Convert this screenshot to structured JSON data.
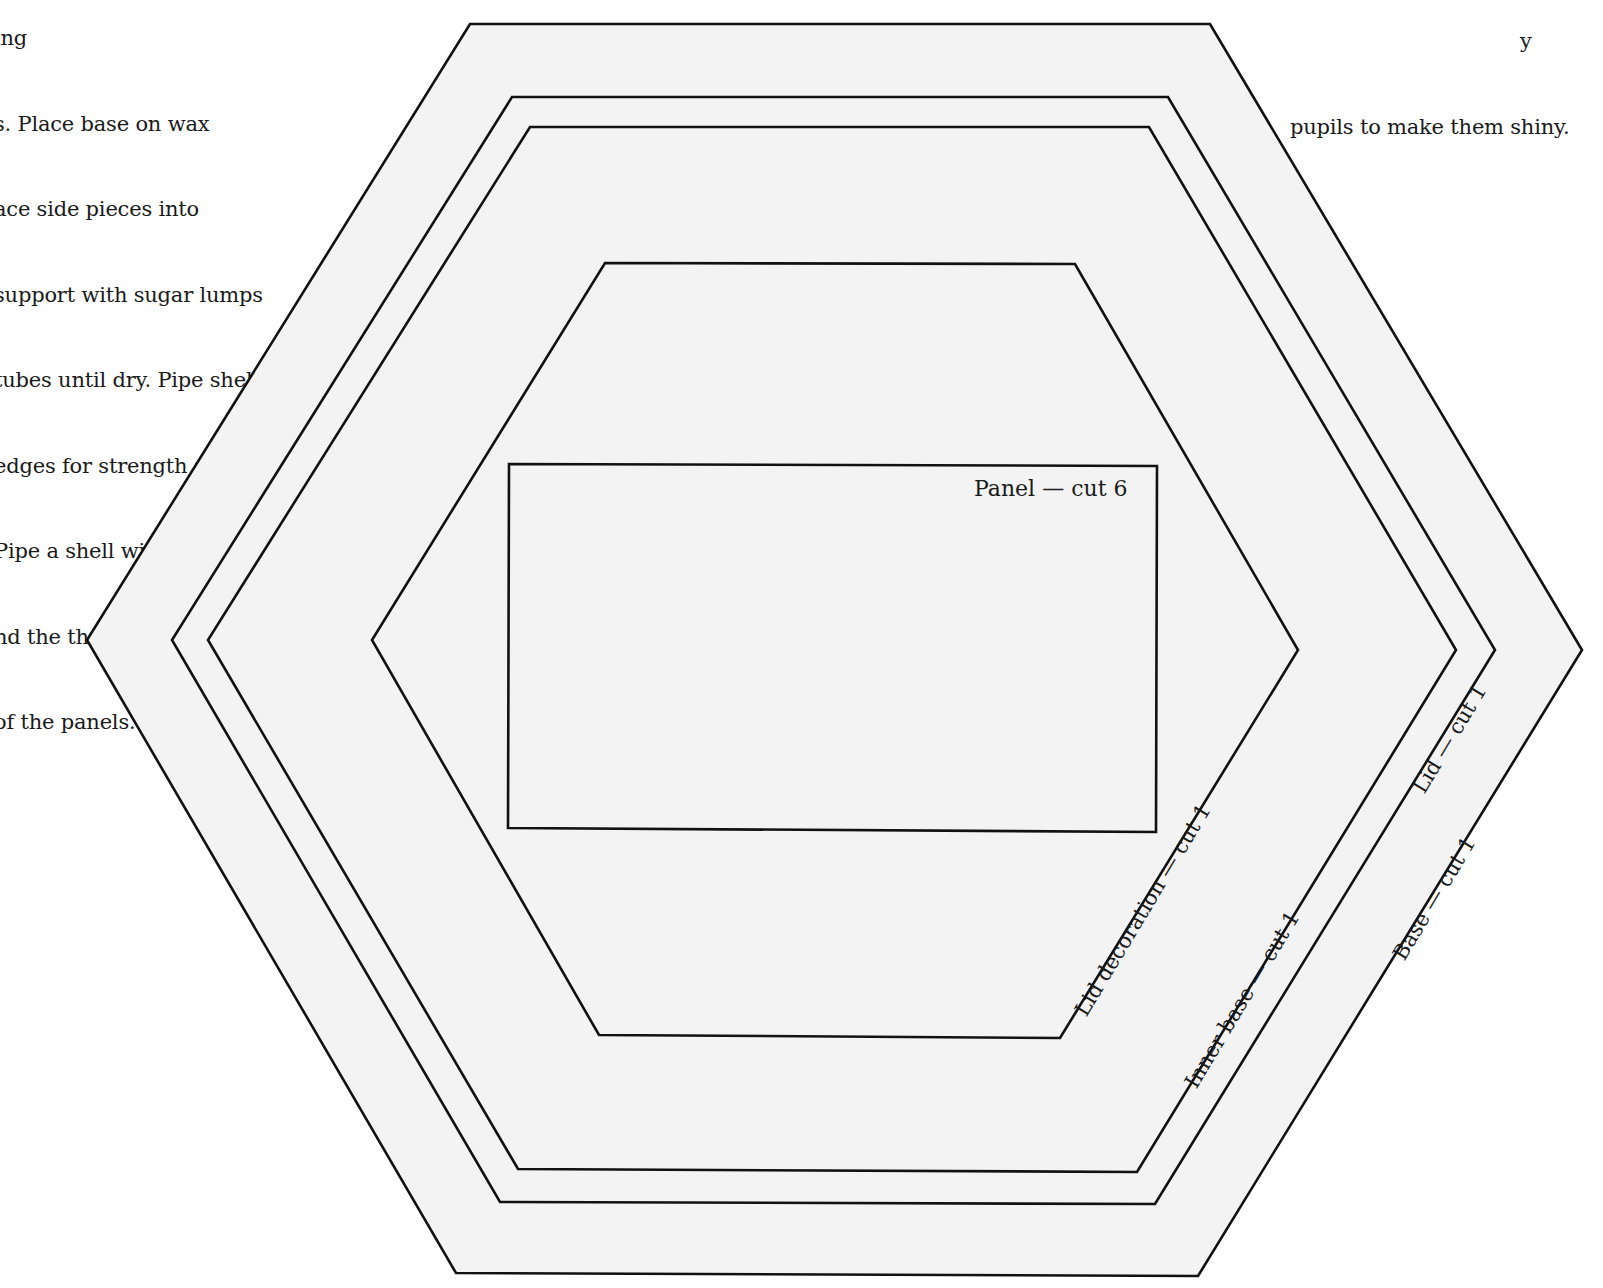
{
  "instructions_left": {
    "lines": [
      "ing",
      "s. Place base on wax",
      "ace side pieces into",
      "support with sugar lumps",
      "tubes until dry. Pipe shells",
      "edges for strength and",
      "Pipe a shell with a No2",
      "nd the three edges and up",
      "of the panels."
    ]
  },
  "instructions_right": {
    "lines": [
      "y",
      "pupils to make them shiny."
    ]
  },
  "template": {
    "background_color": "#ffffff",
    "fill_color": "#f3f3f3",
    "stroke_color": "#111111",
    "pieces": [
      {
        "id": "base",
        "label": "Base — cut 1",
        "shape": "hexagon"
      },
      {
        "id": "lid",
        "label": "Lid — cut 1",
        "shape": "hexagon"
      },
      {
        "id": "inner-base",
        "label": "Inner base — cut 1",
        "shape": "hexagon"
      },
      {
        "id": "lid-decoration",
        "label": "Lid decoration — cut 1",
        "shape": "hexagon"
      },
      {
        "id": "panel",
        "label": "Panel — cut 6",
        "shape": "rectangle"
      }
    ]
  }
}
